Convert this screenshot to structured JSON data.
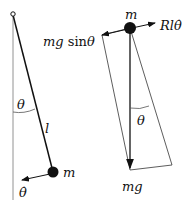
{
  "pendulum": {
    "angle_label": "θ",
    "length_label": "l",
    "mass_label": "m",
    "angular_velocity_label": "θ̇"
  },
  "free_body": {
    "mass_label": "m",
    "tangential_force_label_prefix": "mg ",
    "tangential_force_label_fn": "sin",
    "tangential_force_label_var": "θ",
    "damping_force_label": "Rlθ̇",
    "angle_label": "θ",
    "gravity_label": "mg"
  },
  "colors": {
    "stroke": "#111111",
    "background": "#ffffff"
  }
}
